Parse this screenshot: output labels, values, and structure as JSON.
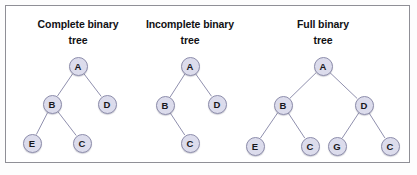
{
  "figure": {
    "background_color": "#fdfdfd",
    "frame_color": "#8f8f96",
    "node_fill": "#dcdcec",
    "node_stroke": "#8e8eac",
    "edge_color": "#9090ae",
    "text_color": "#111114"
  },
  "trees": [
    {
      "id": "complete-binary-tree",
      "title_line1": "Complete binary",
      "title_line2": "tree",
      "title_x": 78,
      "title_y": 16,
      "nodes": [
        {
          "id": "t1-a",
          "label": "A",
          "x": 78,
          "y": 66
        },
        {
          "id": "t1-b",
          "label": "B",
          "x": 52,
          "y": 104
        },
        {
          "id": "t1-d",
          "label": "D",
          "x": 107,
          "y": 104
        },
        {
          "id": "t1-e",
          "label": "E",
          "x": 32,
          "y": 143
        },
        {
          "id": "t1-c",
          "label": "C",
          "x": 82,
          "y": 143
        }
      ],
      "edges": [
        {
          "from": "t1-a",
          "to": "t1-b"
        },
        {
          "from": "t1-a",
          "to": "t1-d"
        },
        {
          "from": "t1-b",
          "to": "t1-e"
        },
        {
          "from": "t1-b",
          "to": "t1-c"
        }
      ]
    },
    {
      "id": "incomplete-binary-tree",
      "title_line1": "Incomplete binary",
      "title_line2": "tree",
      "title_x": 190,
      "title_y": 16,
      "nodes": [
        {
          "id": "t2-a",
          "label": "A",
          "x": 190,
          "y": 66
        },
        {
          "id": "t2-b",
          "label": "B",
          "x": 165,
          "y": 105
        },
        {
          "id": "t2-d",
          "label": "D",
          "x": 217,
          "y": 104
        },
        {
          "id": "t2-c",
          "label": "C",
          "x": 190,
          "y": 143
        }
      ],
      "edges": [
        {
          "from": "t2-a",
          "to": "t2-b"
        },
        {
          "from": "t2-a",
          "to": "t2-d"
        },
        {
          "from": "t2-b",
          "to": "t2-c"
        }
      ]
    },
    {
      "id": "full-binary-tree",
      "title_line1": "Full binary",
      "title_line2": "tree",
      "title_x": 323,
      "title_y": 16,
      "nodes": [
        {
          "id": "t3-a",
          "label": "A",
          "x": 323,
          "y": 66
        },
        {
          "id": "t3-b",
          "label": "B",
          "x": 283,
          "y": 105
        },
        {
          "id": "t3-d",
          "label": "D",
          "x": 364,
          "y": 105
        },
        {
          "id": "t3-e",
          "label": "E",
          "x": 255,
          "y": 146
        },
        {
          "id": "t3-c1",
          "label": "C",
          "x": 310,
          "y": 146
        },
        {
          "id": "t3-g",
          "label": "G",
          "x": 337,
          "y": 146
        },
        {
          "id": "t3-c2",
          "label": "C",
          "x": 390,
          "y": 146
        }
      ],
      "edges": [
        {
          "from": "t3-a",
          "to": "t3-b"
        },
        {
          "from": "t3-a",
          "to": "t3-d"
        },
        {
          "from": "t3-b",
          "to": "t3-e"
        },
        {
          "from": "t3-b",
          "to": "t3-c1"
        },
        {
          "from": "t3-d",
          "to": "t3-g"
        },
        {
          "from": "t3-d",
          "to": "t3-c2"
        }
      ]
    }
  ]
}
